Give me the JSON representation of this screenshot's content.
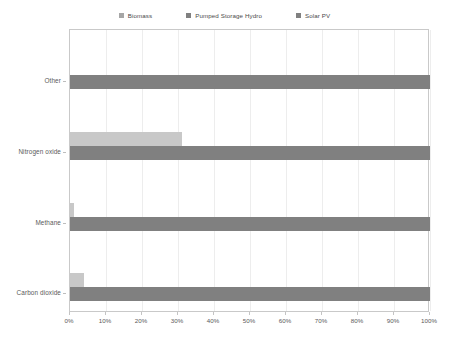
{
  "chart_data": {
    "type": "bar",
    "orientation": "horizontal",
    "title": "",
    "subtitle": "",
    "xlabel": "",
    "ylabel": "",
    "xlim": [
      0,
      100
    ],
    "x_tick_labels": [
      "0%",
      "10%",
      "20%",
      "30%",
      "40%",
      "50%",
      "60%",
      "70%",
      "80%",
      "90%",
      "100%"
    ],
    "x_tick_values": [
      0,
      10,
      20,
      30,
      40,
      50,
      60,
      70,
      80,
      90,
      100
    ],
    "grid": true,
    "grid_axis": "x",
    "legend_position": "top-center",
    "categories": [
      "Carbon dioxide",
      "Methane",
      "Nitrogen oxide",
      "Other"
    ],
    "series": [
      {
        "name": "Biomass",
        "color": "#a6a6a6",
        "values": [
          0,
          0,
          0,
          0
        ]
      },
      {
        "name": "Pumped Storage Hydro",
        "color": "#c8c8c8",
        "values": [
          4,
          1,
          31,
          0
        ]
      },
      {
        "name": "Solar PV",
        "color": "#808080",
        "values": [
          100,
          100,
          100,
          100
        ]
      }
    ]
  },
  "legend": {
    "items": [
      {
        "label": "Biomass",
        "color": "#a6a6a6"
      },
      {
        "label": "Pumped Storage Hydro",
        "color": "#808080"
      },
      {
        "label": "Solar PV",
        "color": "#808080"
      }
    ]
  },
  "axes": {
    "y_labels": [
      "Other",
      "Nitrogen oxide",
      "Methane",
      "Carbon dioxide"
    ],
    "x_labels": [
      "0%",
      "10%",
      "20%",
      "30%",
      "40%",
      "50%",
      "60%",
      "70%",
      "80%",
      "90%",
      "100%"
    ]
  },
  "colors": {
    "plot_border": "#c9c9c9",
    "gridline": "#ededed",
    "background": "#ffffff",
    "text": "#5a5a5a"
  }
}
